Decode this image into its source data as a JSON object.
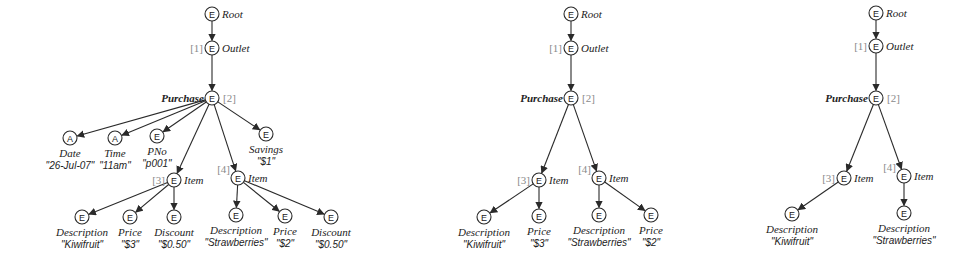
{
  "diagram": {
    "node_radius": 7,
    "trees": [
      {
        "id": "full-tree",
        "nodes": [
          {
            "id": "root",
            "type": "E",
            "x": 212,
            "y": 14,
            "label": "Root",
            "label_pos": "right"
          },
          {
            "id": "outlet",
            "type": "E",
            "x": 212,
            "y": 48,
            "label": "Outlet",
            "label_pos": "right",
            "index": "[1]",
            "index_pos": "left"
          },
          {
            "id": "purchase",
            "type": "E",
            "x": 212,
            "y": 98,
            "label": "Purchase",
            "label_pos": "left",
            "bold": true,
            "index": "[2]",
            "index_pos": "right"
          },
          {
            "id": "date",
            "type": "A",
            "x": 70,
            "y": 138,
            "label": "Date",
            "value": "\"26-Jul-07\"",
            "label_pos": "below"
          },
          {
            "id": "time",
            "type": "A",
            "x": 115,
            "y": 138,
            "label": "Time",
            "value": "\"11am\"",
            "label_pos": "below"
          },
          {
            "id": "pno",
            "type": "E",
            "x": 157,
            "y": 136,
            "label": "PNo",
            "value": "\"p001\"",
            "label_pos": "below"
          },
          {
            "id": "savings",
            "type": "E",
            "x": 266,
            "y": 134,
            "label": "Savings",
            "value": "\"$1\"",
            "label_pos": "below"
          },
          {
            "id": "item3",
            "type": "E",
            "x": 174,
            "y": 180,
            "label": "Item",
            "label_pos": "right",
            "index": "[3]",
            "index_pos": "left"
          },
          {
            "id": "item4",
            "type": "E",
            "x": 238,
            "y": 178,
            "label": "Item",
            "label_pos": "right",
            "index": "[4]",
            "index_pos": "upleft"
          },
          {
            "id": "desc3",
            "type": "E",
            "x": 82,
            "y": 217,
            "label": "Description",
            "value": "\"Kiwifruit\"",
            "label_pos": "below"
          },
          {
            "id": "price3",
            "type": "E",
            "x": 130,
            "y": 217,
            "label": "Price",
            "value": "\"$3\"",
            "label_pos": "below"
          },
          {
            "id": "disc3",
            "type": "E",
            "x": 174,
            "y": 217,
            "label": "Discount",
            "value": "\"$0.50\"",
            "label_pos": "below"
          },
          {
            "id": "desc4",
            "type": "E",
            "x": 236,
            "y": 215,
            "label": "Description",
            "value": "\"Strawberries\"",
            "label_pos": "below"
          },
          {
            "id": "price4",
            "type": "E",
            "x": 285,
            "y": 216,
            "label": "Price",
            "value": "\"$2\"",
            "label_pos": "below"
          },
          {
            "id": "disc4",
            "type": "E",
            "x": 331,
            "y": 217,
            "label": "Discount",
            "value": "\"$0.50\"",
            "label_pos": "below"
          }
        ],
        "edges": [
          [
            "root",
            "outlet"
          ],
          [
            "outlet",
            "purchase"
          ],
          [
            "purchase",
            "date"
          ],
          [
            "purchase",
            "time"
          ],
          [
            "purchase",
            "pno"
          ],
          [
            "purchase",
            "item3"
          ],
          [
            "purchase",
            "item4"
          ],
          [
            "purchase",
            "savings"
          ],
          [
            "item3",
            "desc3"
          ],
          [
            "item3",
            "price3"
          ],
          [
            "item3",
            "disc3"
          ],
          [
            "item4",
            "desc4"
          ],
          [
            "item4",
            "price4"
          ],
          [
            "item4",
            "disc4"
          ]
        ]
      },
      {
        "id": "description-price-tree",
        "nodes": [
          {
            "id": "root",
            "type": "E",
            "x": 571,
            "y": 14,
            "label": "Root",
            "label_pos": "right"
          },
          {
            "id": "outlet",
            "type": "E",
            "x": 571,
            "y": 48,
            "label": "Outlet",
            "label_pos": "right",
            "index": "[1]",
            "index_pos": "left"
          },
          {
            "id": "purchase",
            "type": "E",
            "x": 571,
            "y": 98,
            "label": "Purchase",
            "label_pos": "left",
            "bold": true,
            "index": "[2]",
            "index_pos": "right"
          },
          {
            "id": "item3",
            "type": "E",
            "x": 539,
            "y": 180,
            "label": "Item",
            "label_pos": "right",
            "index": "[3]",
            "index_pos": "left"
          },
          {
            "id": "item4",
            "type": "E",
            "x": 599,
            "y": 178,
            "label": "Item",
            "label_pos": "right",
            "index": "[4]",
            "index_pos": "upleft"
          },
          {
            "id": "desc3",
            "type": "E",
            "x": 484,
            "y": 217,
            "label": "Description",
            "value": "\"Kiwifruit\"",
            "label_pos": "below"
          },
          {
            "id": "price3",
            "type": "E",
            "x": 539,
            "y": 216,
            "label": "Price",
            "value": "\"$3\"",
            "label_pos": "below"
          },
          {
            "id": "desc4",
            "type": "E",
            "x": 599,
            "y": 215,
            "label": "Description",
            "value": "\"Strawberries\"",
            "label_pos": "below"
          },
          {
            "id": "price4",
            "type": "E",
            "x": 651,
            "y": 215,
            "label": "Price",
            "value": "\"$2\"",
            "label_pos": "below"
          }
        ],
        "edges": [
          [
            "root",
            "outlet"
          ],
          [
            "outlet",
            "purchase"
          ],
          [
            "purchase",
            "item3"
          ],
          [
            "purchase",
            "item4"
          ],
          [
            "item3",
            "desc3"
          ],
          [
            "item3",
            "price3"
          ],
          [
            "item4",
            "desc4"
          ],
          [
            "item4",
            "price4"
          ]
        ]
      },
      {
        "id": "description-only-tree",
        "nodes": [
          {
            "id": "root",
            "type": "E",
            "x": 876,
            "y": 13,
            "label": "Root",
            "label_pos": "right"
          },
          {
            "id": "outlet",
            "type": "E",
            "x": 876,
            "y": 46,
            "label": "Outlet",
            "label_pos": "right",
            "index": "[1]",
            "index_pos": "left"
          },
          {
            "id": "purchase",
            "type": "E",
            "x": 876,
            "y": 98,
            "label": "Purchase",
            "label_pos": "left",
            "bold": true,
            "index": "[2]",
            "index_pos": "right"
          },
          {
            "id": "item3",
            "type": "E",
            "x": 844,
            "y": 178,
            "label": "Item",
            "label_pos": "right",
            "index": "[3]",
            "index_pos": "left"
          },
          {
            "id": "item4",
            "type": "E",
            "x": 904,
            "y": 176,
            "label": "Item",
            "label_pos": "right",
            "index": "[4]",
            "index_pos": "upleft"
          },
          {
            "id": "desc3",
            "type": "E",
            "x": 792,
            "y": 214,
            "label": "Description",
            "value": "\"Kiwifruit\"",
            "label_pos": "below"
          },
          {
            "id": "desc4",
            "type": "E",
            "x": 904,
            "y": 213,
            "label": "Description",
            "value": "\"Strawberries\"",
            "label_pos": "below"
          }
        ],
        "edges": [
          [
            "root",
            "outlet"
          ],
          [
            "outlet",
            "purchase"
          ],
          [
            "purchase",
            "item3"
          ],
          [
            "purchase",
            "item4"
          ],
          [
            "item3",
            "desc3"
          ],
          [
            "item4",
            "desc4"
          ]
        ]
      }
    ]
  }
}
